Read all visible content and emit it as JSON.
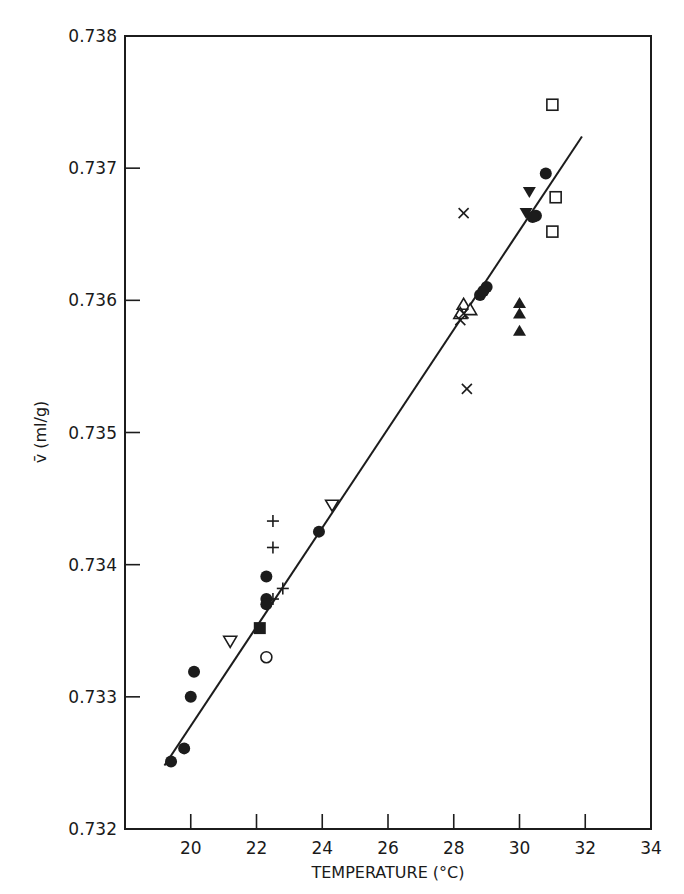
{
  "chart_data": {
    "type": "scatter",
    "title": "",
    "xlabel": "TEMPERATURE (°C)",
    "ylabel": "v̄ (ml/g)",
    "xlim": [
      18,
      34
    ],
    "ylim": [
      0.732,
      0.738
    ],
    "x_ticks": [
      20,
      22,
      24,
      26,
      28,
      30,
      32,
      34
    ],
    "y_ticks": [
      0.732,
      0.733,
      0.734,
      0.735,
      0.736,
      0.737,
      0.738
    ],
    "x_tick_labels": [
      "20",
      "22",
      "24",
      "26",
      "28",
      "30",
      "32",
      "34"
    ],
    "y_tick_labels": [
      "0.732",
      "0.733",
      "0.734",
      "0.735",
      "0.736",
      "0.737",
      "0.738"
    ],
    "grid": false,
    "legend": null,
    "fit_line": {
      "x": [
        19.2,
        31.9
      ],
      "y": [
        0.73248,
        0.73724
      ]
    },
    "series": [
      {
        "name": "filled-circle",
        "marker": "circle-filled",
        "x": [
          19.4,
          19.8,
          20.0,
          20.1,
          22.3,
          22.3,
          22.3,
          23.9,
          28.8,
          29.0,
          28.9,
          30.5,
          30.4,
          30.8
        ],
        "y": [
          0.73251,
          0.73261,
          0.733,
          0.73319,
          0.73391,
          0.73374,
          0.7337,
          0.73425,
          0.73604,
          0.7361,
          0.73607,
          0.73664,
          0.73663,
          0.73696
        ]
      },
      {
        "name": "open-square",
        "marker": "square-open",
        "x": [
          31.0,
          31.1,
          31.0
        ],
        "y": [
          0.73748,
          0.73678,
          0.73652
        ]
      },
      {
        "name": "filled-square",
        "marker": "square-filled",
        "x": [
          22.1
        ],
        "y": [
          0.73352
        ]
      },
      {
        "name": "open-circle",
        "marker": "circle-open",
        "x": [
          22.3
        ],
        "y": [
          0.7333
        ]
      },
      {
        "name": "open-triangle-down",
        "marker": "triangle-down-open",
        "x": [
          21.2,
          24.3
        ],
        "y": [
          0.73342,
          0.73445
        ]
      },
      {
        "name": "open-triangle-up",
        "marker": "triangle-up-open",
        "x": [
          28.3,
          28.5,
          28.2
        ],
        "y": [
          0.73597,
          0.73593,
          0.7359
        ]
      },
      {
        "name": "filled-triangle-down",
        "marker": "triangle-down-filled",
        "x": [
          30.3,
          30.2
        ],
        "y": [
          0.73682,
          0.73666
        ]
      },
      {
        "name": "filled-triangle-up",
        "marker": "triangle-up-filled",
        "x": [
          30.0,
          30.0,
          30.0
        ],
        "y": [
          0.73598,
          0.7359,
          0.73577
        ]
      },
      {
        "name": "plus",
        "marker": "plus",
        "x": [
          22.5,
          22.5,
          22.8,
          22.5
        ],
        "y": [
          0.73433,
          0.73413,
          0.73382,
          0.73374
        ]
      },
      {
        "name": "cross",
        "marker": "x",
        "x": [
          28.3,
          28.4,
          28.2,
          28.3
        ],
        "y": [
          0.73666,
          0.73533,
          0.73585,
          0.7359
        ]
      }
    ]
  }
}
